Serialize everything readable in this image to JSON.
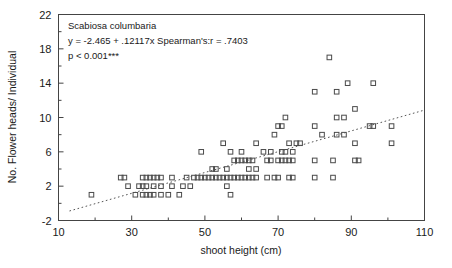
{
  "figure": {
    "background": "#ffffff",
    "frame_color": "#444444",
    "marker_color": "#4a4a4a",
    "fit_line_color": "#555555"
  },
  "annotation": {
    "species": "Scabiosa columbaria",
    "equation": "y = -2.465 + .12117x Spearman's:r = .7403",
    "pvalue": "p < 0.001***"
  },
  "chart_data": {
    "type": "scatter",
    "title": "",
    "xlabel": "shoot height (cm)",
    "ylabel": "No. Flower heads/ Individual",
    "xlim": [
      10,
      110
    ],
    "ylim": [
      -2,
      22
    ],
    "xticks": [
      10,
      30,
      50,
      70,
      90,
      110
    ],
    "xtick_labels": [
      "10",
      "30",
      "50",
      "70",
      "90",
      "110"
    ],
    "xminor_ticks": [
      20,
      40,
      60,
      80,
      100
    ],
    "yticks": [
      -2,
      2,
      6,
      10,
      14,
      18,
      22
    ],
    "ytick_labels": [
      "-2",
      "2",
      "6",
      "10",
      "14",
      "18",
      "22"
    ],
    "grid": false,
    "legend": null,
    "marker": "open-square",
    "annotations": [
      "Scabiosa columbaria",
      "y = -2.465 + .12117x Spearman's:r = .7403",
      "p < 0.001***"
    ],
    "fit_line": {
      "type": "dotted-regression",
      "intercept": -2.465,
      "slope": 0.12117,
      "x_start": 13,
      "x_end": 110,
      "spearman_r": 0.7403,
      "p_text": "p < 0.001***"
    },
    "points": [
      [
        27,
        3
      ],
      [
        28,
        3
      ],
      [
        31,
        1
      ],
      [
        33,
        1
      ],
      [
        34,
        1
      ],
      [
        35,
        1
      ],
      [
        36,
        1
      ],
      [
        38,
        1
      ],
      [
        40,
        1
      ],
      [
        43,
        1
      ],
      [
        19,
        1
      ],
      [
        29,
        2
      ],
      [
        32,
        2
      ],
      [
        33,
        2
      ],
      [
        34,
        2
      ],
      [
        36,
        2
      ],
      [
        38,
        2
      ],
      [
        41,
        2
      ],
      [
        44,
        2
      ],
      [
        46,
        2
      ],
      [
        33,
        3
      ],
      [
        34,
        3
      ],
      [
        35,
        3
      ],
      [
        36,
        3
      ],
      [
        37,
        3
      ],
      [
        38,
        3
      ],
      [
        41,
        3
      ],
      [
        45,
        3
      ],
      [
        47,
        3
      ],
      [
        48,
        3
      ],
      [
        49,
        3
      ],
      [
        50,
        3
      ],
      [
        51,
        3
      ],
      [
        52,
        3
      ],
      [
        53,
        3
      ],
      [
        54,
        3
      ],
      [
        55,
        3
      ],
      [
        56,
        3
      ],
      [
        57,
        3
      ],
      [
        58,
        3
      ],
      [
        59,
        3
      ],
      [
        60,
        3
      ],
      [
        61,
        3
      ],
      [
        62,
        3
      ],
      [
        63,
        3
      ],
      [
        64,
        3
      ],
      [
        49,
        6
      ],
      [
        52,
        4
      ],
      [
        53,
        4
      ],
      [
        55,
        7
      ],
      [
        56,
        4
      ],
      [
        56,
        2
      ],
      [
        57,
        6
      ],
      [
        57,
        1
      ],
      [
        58,
        5
      ],
      [
        59,
        5
      ],
      [
        60,
        5
      ],
      [
        60,
        6
      ],
      [
        61,
        5
      ],
      [
        62,
        5
      ],
      [
        62,
        4
      ],
      [
        63,
        5
      ],
      [
        64,
        7
      ],
      [
        64,
        4
      ],
      [
        67,
        3
      ],
      [
        68,
        6
      ],
      [
        69,
        3
      ],
      [
        69,
        8
      ],
      [
        70,
        3
      ],
      [
        70,
        5
      ],
      [
        70,
        9
      ],
      [
        71,
        5
      ],
      [
        71,
        9
      ],
      [
        72,
        5
      ],
      [
        72,
        6
      ],
      [
        72,
        10
      ],
      [
        73,
        3
      ],
      [
        73,
        5
      ],
      [
        73,
        7
      ],
      [
        74,
        3
      ],
      [
        74,
        5
      ],
      [
        74,
        6
      ],
      [
        75,
        7
      ],
      [
        76,
        7
      ],
      [
        66,
        6
      ],
      [
        67,
        5
      ],
      [
        68,
        5
      ],
      [
        71,
        6
      ],
      [
        80,
        3
      ],
      [
        80,
        5
      ],
      [
        80,
        9
      ],
      [
        80,
        13
      ],
      [
        82,
        8
      ],
      [
        84,
        17
      ],
      [
        85,
        3
      ],
      [
        85,
        5
      ],
      [
        86,
        8
      ],
      [
        86,
        10
      ],
      [
        86,
        13
      ],
      [
        88,
        8
      ],
      [
        88,
        10
      ],
      [
        89,
        14
      ],
      [
        91,
        5
      ],
      [
        91,
        7
      ],
      [
        91,
        11
      ],
      [
        92,
        5
      ],
      [
        95,
        9
      ],
      [
        96,
        9
      ],
      [
        96,
        14
      ],
      [
        101,
        7
      ],
      [
        101,
        9
      ]
    ],
    "n_points": 113
  }
}
